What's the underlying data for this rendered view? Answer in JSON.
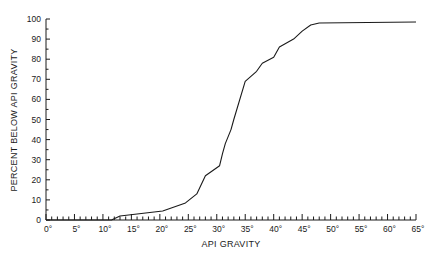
{
  "chart_data": {
    "type": "line",
    "title": "",
    "xlabel": "API GRAVITY",
    "ylabel": "PERCENT BELOW API GRAVITY",
    "xlim": [
      0,
      65
    ],
    "ylim": [
      0,
      100
    ],
    "grid": false,
    "legend": null,
    "x_ticks": [
      0,
      5,
      10,
      15,
      20,
      25,
      30,
      35,
      40,
      45,
      50,
      55,
      60,
      65
    ],
    "x_tick_labels": [
      "0°",
      "5°",
      "10°",
      "15°",
      "20°",
      "25°",
      "30°",
      "35°",
      "40°",
      "45°",
      "50°",
      "55°",
      "60°",
      "65°"
    ],
    "x_minor_step": 1,
    "y_ticks": [
      0,
      10,
      20,
      30,
      40,
      50,
      60,
      70,
      80,
      90,
      100
    ],
    "y_tick_labels": [
      "0",
      "10",
      "20",
      "30",
      "40",
      "50",
      "60",
      "70",
      "80",
      "90",
      "100"
    ],
    "y_minor_step": 5,
    "series": [
      {
        "name": "Cumulative percent below API gravity",
        "color": "#1a1a1a",
        "x": [
          0,
          10,
          11.5,
          13,
          20.5,
          24.5,
          26.5,
          28,
          30.5,
          31,
          31.5,
          32.5,
          33,
          35,
          37,
          38,
          40,
          41,
          43.5,
          45,
          46.5,
          48,
          65
        ],
        "y": [
          0,
          0,
          0,
          2,
          4.5,
          8.5,
          13,
          22,
          27,
          33,
          38,
          45,
          50,
          69,
          74,
          78,
          81,
          86,
          90,
          94,
          97,
          98,
          98.5
        ]
      }
    ]
  }
}
